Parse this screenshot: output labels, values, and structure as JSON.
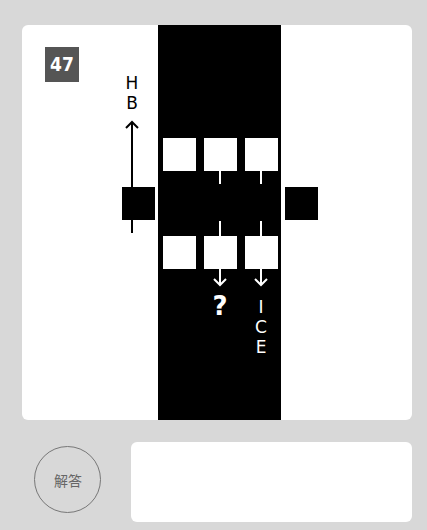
{
  "puzzle": {
    "number": "47",
    "left_letters": [
      "H",
      "B"
    ],
    "question_mark": "?",
    "right_letters": [
      "I",
      "C",
      "E"
    ]
  },
  "answer": {
    "label": "解答",
    "value": ""
  }
}
